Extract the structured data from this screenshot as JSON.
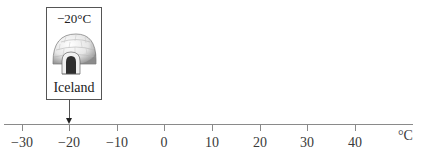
{
  "axis": {
    "unit": "°C",
    "ticks": [
      {
        "value": -30,
        "label": "−30",
        "x": 22
      },
      {
        "value": -20,
        "label": "−20",
        "x": 69
      },
      {
        "value": -10,
        "label": "−10",
        "x": 117
      },
      {
        "value": 0,
        "label": "0",
        "x": 164
      },
      {
        "value": 10,
        "label": "10",
        "x": 212
      },
      {
        "value": 20,
        "label": "20",
        "x": 260
      },
      {
        "value": 30,
        "label": "30",
        "x": 307
      },
      {
        "value": 40,
        "label": "40",
        "x": 355
      }
    ]
  },
  "marker": {
    "temperature": "−20°C",
    "value": -20,
    "place": "Iceland",
    "icon": "igloo-icon"
  },
  "colors": {
    "axis": "#8a8a8a",
    "text": "#333333",
    "card_border": "#555555"
  }
}
